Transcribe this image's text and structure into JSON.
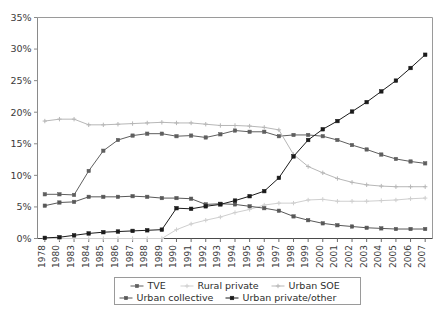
{
  "chart_data": {
    "type": "line",
    "title": "",
    "xlabel": "",
    "ylabel": "",
    "ylim": [
      0,
      35
    ],
    "ytick_labels": [
      "0%",
      "5%",
      "10%",
      "15%",
      "20%",
      "25%",
      "30%",
      "35%"
    ],
    "ytick_values": [
      0,
      5,
      10,
      15,
      20,
      25,
      30,
      35
    ],
    "grid": false,
    "legend_position": "bottom",
    "categories": [
      "1978",
      "1980",
      "1983",
      "1984",
      "1985",
      "1986",
      "1987",
      "1988",
      "1989",
      "1990",
      "1991",
      "1992",
      "1993",
      "1994",
      "1995",
      "1996",
      "1997",
      "1998",
      "1999",
      "2000",
      "2001",
      "2002",
      "2003",
      "2004",
      "2005",
      "2006",
      "2007"
    ],
    "series": [
      {
        "name": "TVE",
        "color": "#5f5f5f",
        "marker": "square",
        "values": [
          7.0,
          7.0,
          6.9,
          10.7,
          13.9,
          15.6,
          16.3,
          16.6,
          16.6,
          16.2,
          16.3,
          16.0,
          16.5,
          17.1,
          16.9,
          16.9,
          16.2,
          16.4,
          16.4,
          16.2,
          15.6,
          14.8,
          14.1,
          13.3,
          12.6,
          12.2,
          11.9
        ]
      },
      {
        "name": "Rural private",
        "color": "#cfcfcf",
        "marker": "plus",
        "values": [
          0.0,
          0.0,
          0.0,
          0.0,
          0.0,
          0.0,
          0.0,
          0.0,
          0.0,
          1.4,
          2.3,
          2.9,
          3.4,
          4.1,
          4.6,
          5.3,
          5.6,
          5.6,
          6.1,
          6.2,
          5.9,
          5.9,
          5.9,
          6.0,
          6.1,
          6.3,
          6.4
        ]
      },
      {
        "name": "Urban SOE",
        "color": "#b7b7b7",
        "marker": "plus",
        "values": [
          18.6,
          18.9,
          18.9,
          18.0,
          18.0,
          18.1,
          18.2,
          18.3,
          18.4,
          18.3,
          18.3,
          18.1,
          17.9,
          17.9,
          17.8,
          17.6,
          17.2,
          13.3,
          11.4,
          10.4,
          9.5,
          8.9,
          8.5,
          8.3,
          8.2,
          8.2,
          8.2
        ]
      },
      {
        "name": "Urban collective",
        "color": "#585858",
        "marker": "square",
        "values": [
          5.2,
          5.7,
          5.8,
          6.6,
          6.6,
          6.6,
          6.7,
          6.6,
          6.4,
          6.4,
          6.3,
          5.4,
          5.5,
          5.4,
          5.1,
          4.8,
          4.4,
          3.5,
          2.9,
          2.4,
          2.1,
          1.9,
          1.7,
          1.6,
          1.5,
          1.5,
          1.5
        ]
      },
      {
        "name": "Urban private/other",
        "color": "#1b1b1b",
        "marker": "diamond",
        "values": [
          0.1,
          0.2,
          0.5,
          0.8,
          1.0,
          1.1,
          1.2,
          1.3,
          1.4,
          4.8,
          4.7,
          5.1,
          5.4,
          6.0,
          6.7,
          7.5,
          9.6,
          13.0,
          15.6,
          17.3,
          18.6,
          20.1,
          21.6,
          23.3,
          25.0,
          27.0,
          29.1
        ]
      }
    ],
    "legend": [
      {
        "label": "TVE",
        "color": "#5f5f5f",
        "marker": "square"
      },
      {
        "label": "Rural private",
        "color": "#cfcfcf",
        "marker": "plus"
      },
      {
        "label": "Urban SOE",
        "color": "#b7b7b7",
        "marker": "plus"
      },
      {
        "label": "Urban collective",
        "color": "#585858",
        "marker": "square"
      },
      {
        "label": "Urban private/other",
        "color": "#1b1b1b",
        "marker": "diamond"
      }
    ]
  },
  "caption": {
    "text": ""
  }
}
